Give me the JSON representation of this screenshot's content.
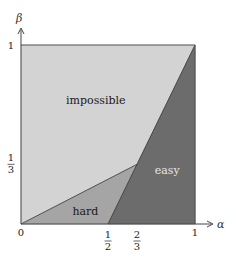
{
  "diagram": {
    "axes": {
      "x": {
        "name": "α",
        "range": [
          0,
          1
        ]
      },
      "y": {
        "name": "β",
        "range": [
          0,
          1
        ]
      }
    },
    "x_ticks": [
      {
        "value": 0,
        "label": "0",
        "kind": "plain"
      },
      {
        "value": 0.5,
        "num": "1",
        "den": "2",
        "kind": "frac"
      },
      {
        "value": 0.6667,
        "num": "2",
        "den": "3",
        "kind": "frac"
      },
      {
        "value": 1,
        "label": "1",
        "kind": "plain"
      }
    ],
    "y_ticks": [
      {
        "value": 1,
        "label": "1",
        "kind": "plain"
      },
      {
        "value": 0.3333,
        "num": "1",
        "den": "3",
        "kind": "frac"
      }
    ],
    "regions": [
      {
        "id": "impossible",
        "label": "impossible",
        "color": "#d3d3d3",
        "text_color": "#1a1a1a",
        "polygon": [
          [
            0,
            0
          ],
          [
            0,
            1
          ],
          [
            1,
            1
          ],
          [
            0.6667,
            0.3333
          ]
        ],
        "label_at": [
          0.43,
          0.69
        ]
      },
      {
        "id": "hard",
        "label": "hard",
        "color": "#a5a5a5",
        "text_color": "#1a1a1a",
        "polygon": [
          [
            0,
            0
          ],
          [
            0.5,
            0
          ],
          [
            0.6667,
            0.3333
          ]
        ],
        "label_at": [
          0.37,
          0.07
        ]
      },
      {
        "id": "easy",
        "label": "easy",
        "color": "#6c6c6c",
        "text_color": "#e6e6e6",
        "polygon": [
          [
            0.5,
            0
          ],
          [
            1,
            0
          ],
          [
            1,
            1
          ],
          [
            0.6667,
            0.3333
          ]
        ],
        "label_at": [
          0.84,
          0.3
        ]
      }
    ],
    "boundaries": [
      [
        [
          0,
          0
        ],
        [
          0.6667,
          0.3333
        ]
      ],
      [
        [
          0.5,
          0
        ],
        [
          1,
          1
        ]
      ]
    ],
    "frame_color": "#555555"
  }
}
